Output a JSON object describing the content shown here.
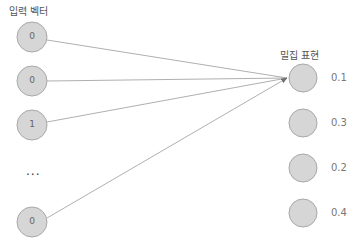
{
  "input": {
    "title": "입력 벡터",
    "nodes": [
      {
        "value": "0",
        "cy": 37
      },
      {
        "value": "0",
        "cy": 81
      },
      {
        "value": "1",
        "cy": 125
      },
      {
        "value": "0",
        "cy": 222
      }
    ],
    "ellipsis": "..."
  },
  "output": {
    "title": "밀집 표현",
    "nodes": [
      {
        "value": "0.1",
        "cy": 78
      },
      {
        "value": "0.3",
        "cy": 123
      },
      {
        "value": "0.2",
        "cy": 168
      },
      {
        "value": "0.4",
        "cy": 213
      }
    ]
  },
  "colors": {
    "node_fill": "#d6d6d6",
    "node_stroke": "#a8a8a8",
    "edge": "#9a9a9a",
    "arrow": "#6f6f6f"
  }
}
